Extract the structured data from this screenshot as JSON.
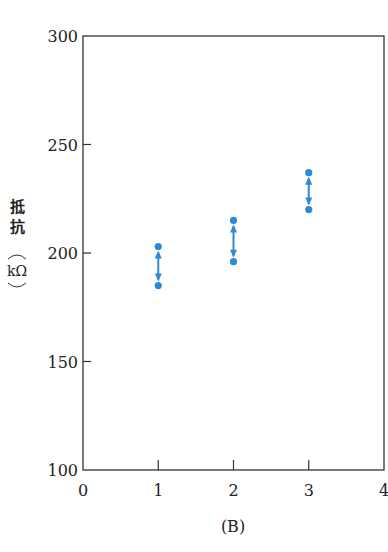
{
  "chart_data": {
    "type": "scatter",
    "title": "",
    "caption": "(B)",
    "xlabel": "",
    "ylabel": "抵抗 (kΩ)",
    "ylabel_chars": [
      "抵",
      "抗"
    ],
    "ylabel_unit": "kΩ",
    "xlim": [
      0,
      4
    ],
    "ylim": [
      100,
      300
    ],
    "x_ticks": [
      0,
      1,
      2,
      3,
      4
    ],
    "y_ticks": [
      100,
      150,
      200,
      250,
      300
    ],
    "grid": false,
    "legend": null,
    "marker_color": "#2f8ad6",
    "series": [
      {
        "name": "range",
        "points": [
          {
            "x": 1,
            "y_low": 185,
            "y_high": 203
          },
          {
            "x": 2,
            "y_low": 196,
            "y_high": 215
          },
          {
            "x": 3,
            "y_low": 220,
            "y_high": 237
          }
        ]
      }
    ],
    "annotations": [
      "double-headed arrow between each pair of dots"
    ]
  }
}
